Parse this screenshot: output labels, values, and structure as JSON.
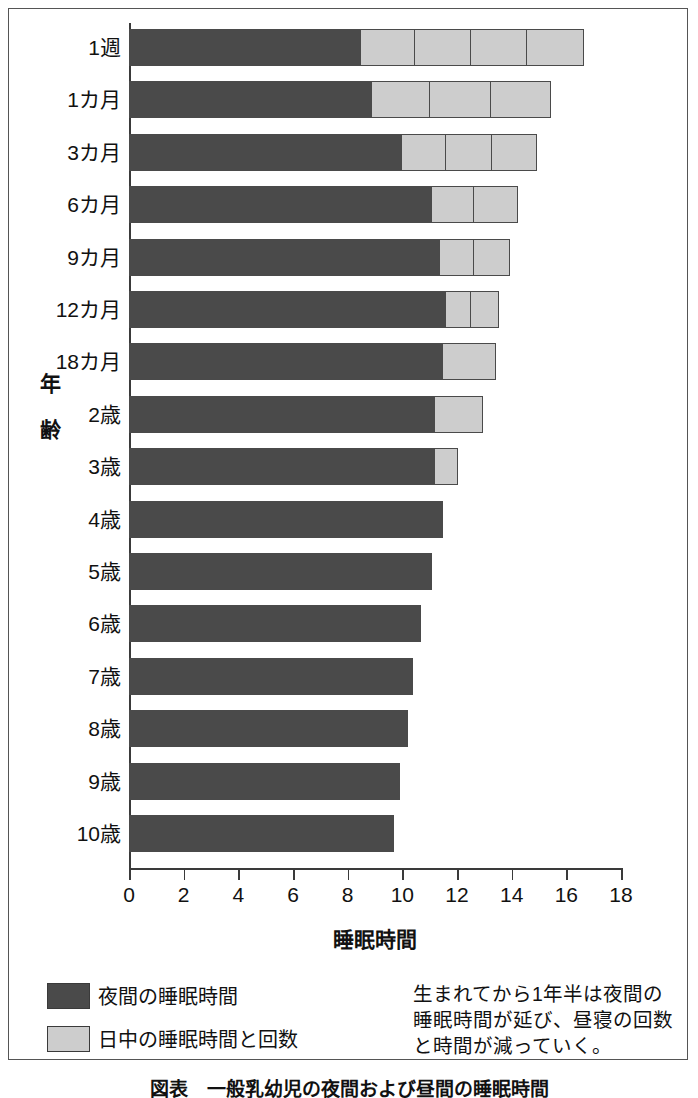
{
  "chart_data": {
    "type": "bar",
    "orientation": "horizontal",
    "stacked": true,
    "title": "",
    "xlabel": "睡眠時間",
    "ylabel": "年齢",
    "xlim": [
      0,
      18
    ],
    "xticks": [
      0,
      2,
      4,
      6,
      8,
      10,
      12,
      14,
      16,
      18
    ],
    "grid": false,
    "legend_position": "bottom-left",
    "categories": [
      "1週",
      "1カ月",
      "3カ月",
      "6カ月",
      "9カ月",
      "12カ月",
      "18カ月",
      "2歳",
      "3歳",
      "4歳",
      "5歳",
      "6歳",
      "7歳",
      "8歳",
      "9歳",
      "10歳"
    ],
    "series": [
      {
        "name": "夜間の睡眠時間",
        "color": "#4a4a4a",
        "values": [
          8.5,
          8.9,
          10.0,
          11.1,
          11.4,
          11.6,
          11.5,
          11.2,
          11.2,
          11.5,
          11.1,
          10.7,
          10.4,
          10.2,
          9.9,
          9.7
        ]
      },
      {
        "name": "日中の睡眠時間と回数",
        "color": "#cdcdcd",
        "nap_segments": [
          [
            2.05,
            2.05,
            2.05,
            2.05
          ],
          [
            2.2,
            2.2,
            2.2
          ],
          [
            1.67,
            1.67,
            1.66
          ],
          [
            1.6,
            1.6
          ],
          [
            1.3,
            1.3
          ],
          [
            1.0,
            1.0
          ],
          [
            2.0
          ],
          [
            1.8
          ],
          [
            0.9
          ],
          [],
          [],
          [],
          [],
          [],
          [],
          []
        ],
        "totals": [
          16.7,
          15.5,
          15.0,
          14.3,
          14.0,
          13.6,
          13.5,
          13.0,
          12.1,
          11.5,
          11.1,
          10.7,
          10.4,
          10.2,
          9.9,
          9.7
        ]
      }
    ],
    "annotation": "生まれてから1年半は夜間の睡眠時間が延び、昼寝の回数と時間が減っていく。"
  },
  "axes": {
    "y_title_chars": [
      "年",
      "齢"
    ],
    "x_title": "睡眠時間",
    "x_tick_labels": [
      "0",
      "2",
      "4",
      "6",
      "8",
      "10",
      "12",
      "14",
      "16",
      "18"
    ],
    "y_tick_labels": [
      "1週",
      "1カ月",
      "3カ月",
      "6カ月",
      "9カ月",
      "12カ月",
      "18カ月",
      "2歳",
      "3歳",
      "4歳",
      "5歳",
      "6歳",
      "7歳",
      "8歳",
      "9歳",
      "10歳"
    ]
  },
  "legend": {
    "items": [
      {
        "label": "夜間の睡眠時間",
        "color": "#4a4a4a"
      },
      {
        "label": "日中の睡眠時間と回数",
        "color": "#cdcdcd"
      }
    ]
  },
  "annotation": {
    "lines": [
      "生まれてから1年半は夜間の",
      "睡眠時間が延び、昼寝の回数",
      "と時間が減っていく。"
    ]
  },
  "caption": {
    "text": "図表　一般乳幼児の夜間および昼間の睡眠時間"
  },
  "colors": {
    "night": "#4a4a4a",
    "nap": "#cdcdcd",
    "axis": "#3a3a3a",
    "frame": "#555555",
    "background": "#ffffff"
  }
}
